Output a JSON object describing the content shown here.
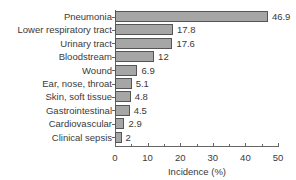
{
  "chart_data": {
    "type": "bar",
    "orientation": "horizontal",
    "title": "",
    "categories": [
      "Pneumonia",
      "Lower respiratory tract",
      "Urinary tract",
      "Bloodstream",
      "Wound",
      "Ear, nose, throat",
      "Skin, soft tissue",
      "Gastrointestinal",
      "Cardiovascular",
      "Clinical sepsis"
    ],
    "values": [
      46.9,
      17.8,
      17.6,
      12,
      6.9,
      5.1,
      4.8,
      4.5,
      2.9,
      2
    ],
    "value_labels": [
      "46.9",
      "17.8",
      "17.6",
      "12",
      "6.9",
      "5.1",
      "4.8",
      "4.5",
      "2.9",
      "2"
    ],
    "xlabel": "Incidence (%)",
    "ylabel": "",
    "xlim": [
      0,
      50
    ],
    "xticks": [
      0,
      10,
      20,
      30,
      40,
      50
    ],
    "xtick_labels": [
      "0",
      "10",
      "20",
      "30",
      "40",
      "50"
    ],
    "grid": false,
    "legend": null,
    "bar_color": "#a6a6a6",
    "bar_edge_color": "#555555"
  }
}
